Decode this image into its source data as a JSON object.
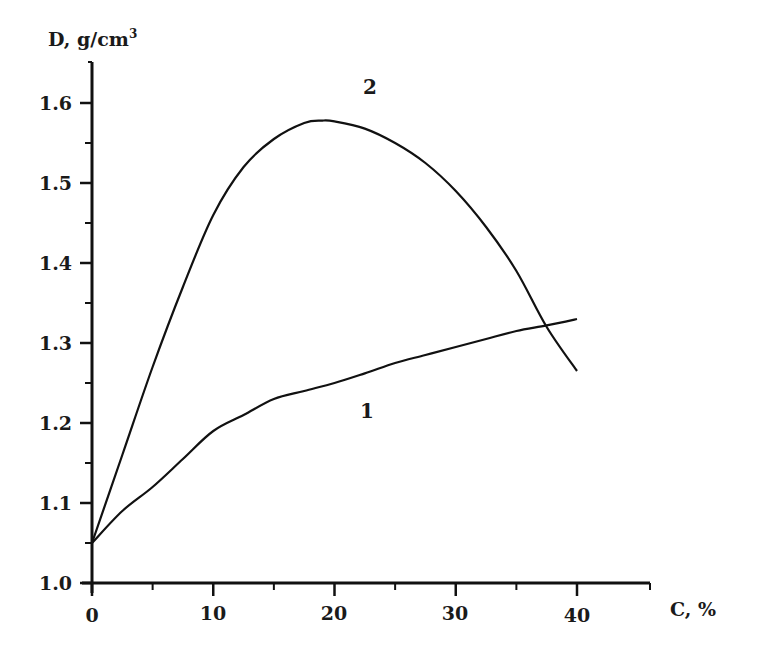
{
  "chart_data": {
    "type": "line",
    "title": "",
    "xlabel": "C, %",
    "ylabel": "D, g/cm³",
    "xlim": [
      0,
      46
    ],
    "ylim": [
      1.0,
      1.65
    ],
    "x_ticks": [
      0,
      10,
      20,
      30,
      40
    ],
    "x_minor_ticks": [
      5,
      15,
      25,
      35,
      45
    ],
    "y_ticks": [
      1.0,
      1.1,
      1.2,
      1.3,
      1.4,
      1.5,
      1.6
    ],
    "y_minor_ticks": [
      1.05,
      1.15,
      1.25,
      1.35,
      1.45,
      1.55
    ],
    "x_tick_labels": [
      "0",
      "10",
      "20",
      "30",
      "40"
    ],
    "y_tick_labels": [
      "1.0",
      "1.1",
      "1.2",
      "1.3",
      "1.4",
      "1.5",
      "1.6"
    ],
    "grid": false,
    "legend": "none (curves labelled inline)",
    "series": [
      {
        "name": "1",
        "x": [
          0,
          2.5,
          5,
          7.5,
          10,
          12.5,
          15,
          17.5,
          20,
          22.5,
          25,
          27.5,
          30,
          32.5,
          35,
          37.5,
          40
        ],
        "values": [
          1.05,
          1.09,
          1.12,
          1.155,
          1.19,
          1.21,
          1.23,
          1.24,
          1.25,
          1.262,
          1.275,
          1.285,
          1.295,
          1.305,
          1.315,
          1.322,
          1.33
        ],
        "label_position": {
          "x": 22.5,
          "y": 1.215
        }
      },
      {
        "name": "2",
        "x": [
          0,
          2.5,
          5,
          7.5,
          10,
          12.5,
          15,
          17.5,
          19,
          20,
          22.5,
          25,
          27.5,
          30,
          32.5,
          35,
          37.5,
          40
        ],
        "values": [
          1.05,
          1.16,
          1.27,
          1.37,
          1.46,
          1.52,
          1.555,
          1.575,
          1.578,
          1.577,
          1.568,
          1.55,
          1.525,
          1.49,
          1.445,
          1.39,
          1.32,
          1.265
        ],
        "label_position": {
          "x": 22.5,
          "y": 1.62
        }
      }
    ]
  },
  "labels": {
    "y_axis_title": "D, g/cm",
    "y_axis_title_sup": "3",
    "x_axis_title": "C, %",
    "curve_1": "1",
    "curve_2": "2",
    "y_ticks": [
      "1.0",
      "1.1",
      "1.2",
      "1.3",
      "1.4",
      "1.5",
      "1.6"
    ],
    "x_ticks": [
      "0",
      "10",
      "20",
      "30",
      "40"
    ]
  }
}
